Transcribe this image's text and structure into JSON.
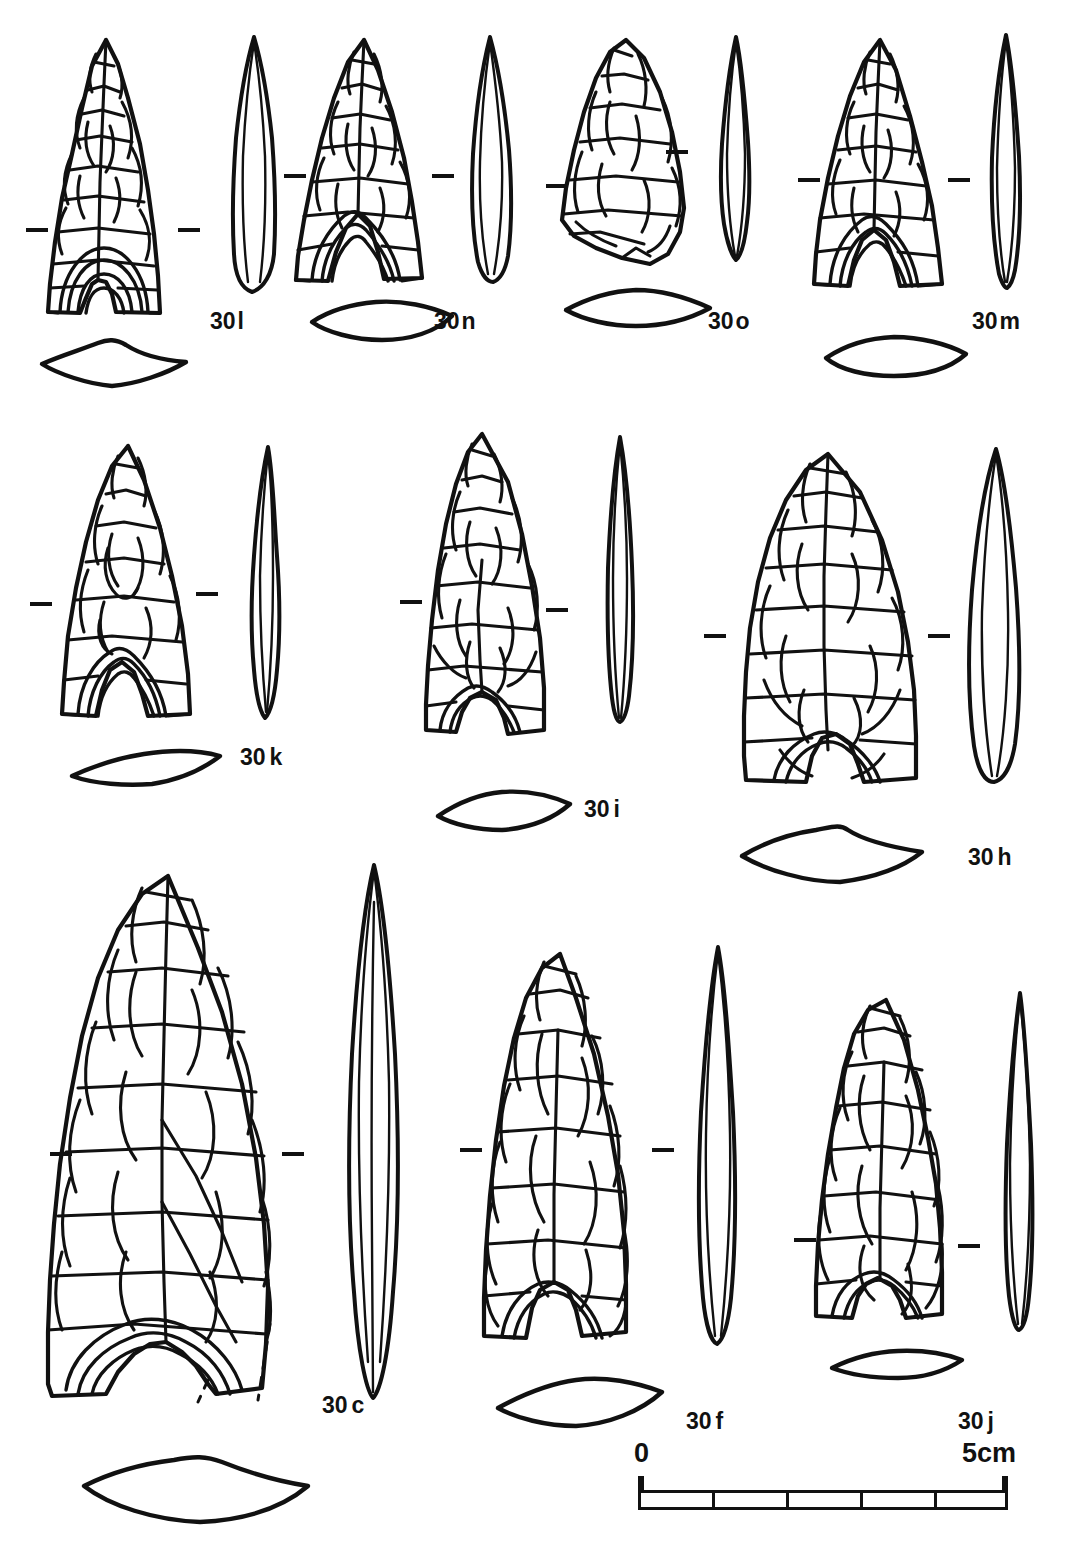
{
  "figure": {
    "kind": "archaeological-plate",
    "ink_color": "#111111",
    "background_color": "#ffffff",
    "rows": 3
  },
  "scale": {
    "zero_label": "0",
    "max_label": "5cm",
    "segments": 5,
    "unit": "cm",
    "total_cm": 5
  },
  "specimens": [
    {
      "id": "30l",
      "label_num": "30",
      "label_suffix": "l",
      "label_text": "30 l",
      "row": 1,
      "base": "concave-fluted",
      "views": [
        "face",
        "profile",
        "cross-section"
      ]
    },
    {
      "id": "30n",
      "label_num": "30",
      "label_suffix": "n",
      "label_text": "30 n",
      "row": 1,
      "base": "deeply-notched",
      "views": [
        "face",
        "profile",
        "cross-section"
      ]
    },
    {
      "id": "30o",
      "label_num": "30",
      "label_suffix": "o",
      "label_text": "30 o",
      "row": 1,
      "base": "broken-oblique",
      "views": [
        "face",
        "profile",
        "cross-section"
      ]
    },
    {
      "id": "30m",
      "label_num": "30",
      "label_suffix": "m",
      "label_text": "30 m",
      "row": 1,
      "base": "deeply-notched",
      "views": [
        "face",
        "profile",
        "cross-section"
      ]
    },
    {
      "id": "30k",
      "label_num": "30",
      "label_suffix": "k",
      "label_text": "30 k",
      "row": 2,
      "base": "concave-fluted",
      "views": [
        "face",
        "profile",
        "cross-section"
      ]
    },
    {
      "id": "30i",
      "label_num": "30",
      "label_suffix": "i",
      "label_text": "30 i",
      "row": 2,
      "base": "concave",
      "views": [
        "face",
        "profile",
        "cross-section"
      ]
    },
    {
      "id": "30h",
      "label_num": "30",
      "label_suffix": "h",
      "label_text": "30 h",
      "row": 2,
      "base": "concave",
      "views": [
        "face",
        "profile",
        "cross-section"
      ]
    },
    {
      "id": "30c",
      "label_num": "30",
      "label_suffix": "c",
      "label_text": "30 c",
      "row": 3,
      "base": "concave-fluted",
      "views": [
        "face",
        "profile",
        "cross-section"
      ]
    },
    {
      "id": "30f",
      "label_num": "30",
      "label_suffix": "f",
      "label_text": "30 f",
      "row": 3,
      "base": "concave",
      "views": [
        "face",
        "profile",
        "cross-section"
      ]
    },
    {
      "id": "30j",
      "label_num": "30",
      "label_suffix": "j",
      "label_text": "30 j",
      "row": 3,
      "base": "concave",
      "views": [
        "face",
        "profile",
        "cross-section"
      ]
    }
  ]
}
